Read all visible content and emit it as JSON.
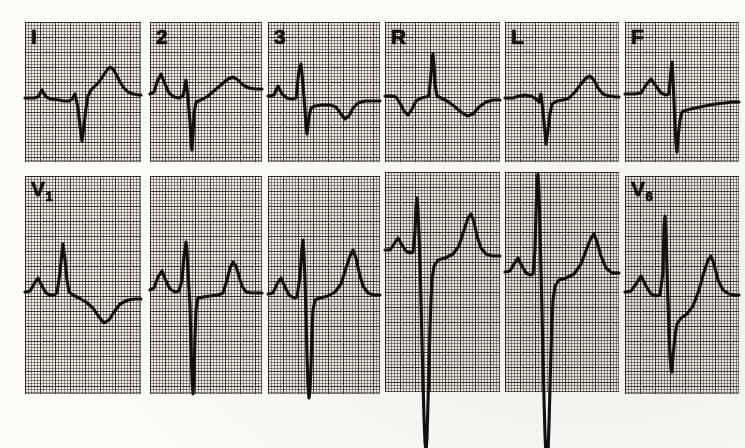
{
  "document": {
    "kind": "12-lead electrocardiogram tracing",
    "paper": "pink ECG graph paper, 1 mm fine grid, 5 mm bold grid",
    "rows": 2,
    "columns": 6,
    "trace_color": "#12100e",
    "grid_bold_color": "#282019",
    "grid_fine_color": "#372d28",
    "paper_color": "#f5efe9",
    "background_color": "#fcfbf8"
  },
  "leads": [
    {
      "id": "lead-1",
      "label": "I",
      "label_sub": "",
      "row": 0,
      "column": 0,
      "x": 25,
      "y": 22,
      "width": 116,
      "height": 140,
      "baseline_y": 76,
      "morphology": "small P, small r, deep narrow QS, elevated ST, broad tall T",
      "path": "M0,76 L9,76 L13,75 L17,68 L21,75 L26,77 L34,78 L39,79 L44,79 L47,77 L50,72 L53,86 L55,104 L57,119 L59,104 L61,86 L63,74 L66,68 L70,64 L74,60 L78,54 L82,48 L85,45 L88,47 L91,52 L95,60 L99,66 L103,70 L108,72 L114,73 L116,73"
    },
    {
      "id": "lead-2",
      "label": "2",
      "label_sub": "",
      "row": 0,
      "column": 1,
      "x": 150,
      "y": 22,
      "width": 112,
      "height": 140,
      "baseline_y": 72,
      "morphology": "P wave, small r, very deep narrow S, elevated ST, broad T",
      "path": "M0,72 L4,70 L7,60 L11,52 L15,62 L19,71 L24,75 L29,76 L33,74 L36,58 L38,76 L40,100 L41,120 L42,128 L43,112 L44,92 L46,80 L51,78 L58,74 L65,68 L72,62 L78,57 L83,55 L88,58 L93,63 L99,66 L106,67 L112,67"
    },
    {
      "id": "lead-3",
      "label": "3",
      "label_sub": "",
      "row": 0,
      "column": 2,
      "x": 268,
      "y": 22,
      "width": 112,
      "height": 140,
      "baseline_y": 74,
      "morphology": "P wave, tall narrow R, deep S, depressed ST with inverted T",
      "path": "M0,74 L6,73 L10,64 L14,72 L19,76 L24,77 L28,76 L31,48 L33,42 L35,62 L37,88 L38,104 L39,112 L41,95 L43,86 L47,84 L54,83 L62,83 L68,85 L73,92 L77,97 L81,94 L85,86 L90,81 L97,79 L105,79 L112,79"
    },
    {
      "id": "lead-R",
      "label": "R",
      "label_sub": "",
      "row": 0,
      "column": 3,
      "x": 385,
      "y": 22,
      "width": 115,
      "height": 140,
      "baseline_y": 74,
      "morphology": "inverted P, tall narrow R spike, inverted T (aVR)",
      "path": "M0,74 L6,74 L11,75 L15,81 L19,89 L23,93 L27,87 L31,79 L36,76 L41,75 L44,74 L46,52 L47,36 L48,32 L49,44 L50,62 L52,74 L56,76 L62,79 L69,84 L76,90 L82,94 L88,92 L94,85 L101,80 L108,78 L115,78"
    },
    {
      "id": "lead-L",
      "label": "L",
      "label_sub": "",
      "row": 0,
      "column": 4,
      "x": 505,
      "y": 22,
      "width": 114,
      "height": 140,
      "baseline_y": 76,
      "morphology": "small P, deep narrow QS, elevated ST, prominent peaked T (aVL)",
      "path": "M0,76 L8,76 L14,74 L20,73 L26,74 L31,77 L34,80 L36,72 L38,90 L40,110 L41,122 L43,108 L45,92 L47,82 L52,79 L58,78 L64,76 L70,70 L76,62 L81,56 L85,54 L89,58 L93,66 L98,72 L104,74 L110,75 L114,75"
    },
    {
      "id": "lead-F",
      "label": "F",
      "label_sub": "",
      "row": 0,
      "column": 5,
      "x": 625,
      "y": 22,
      "width": 114,
      "height": 140,
      "baseline_y": 72,
      "morphology": "P wave, tall narrow R, very deep S, flat depressed ST (aVF)",
      "path": "M0,72 L10,72 L16,71 L21,63 L26,57 L31,64 L36,71 L41,73 L44,72 L46,48 L47,40 L48,56 L49,80 L50,104 L51,122 L52,130 L53,116 L55,98 L57,90 L62,88 L70,86 L80,84 L90,82 L100,81 L108,80 L114,80"
    },
    {
      "id": "lead-V1",
      "label": "V",
      "label_sub": "1",
      "row": 1,
      "column": 0,
      "x": 25,
      "y": 176,
      "width": 116,
      "height": 218,
      "baseline_y": 116,
      "morphology": "small P, narrow tall-ish R, no S, depressed ST with inverted T",
      "path": "M0,116 L5,115 L9,108 L13,102 L17,110 L21,117 L25,119 L29,119 L32,117 L35,96 L37,76 L38,68 L40,84 L42,104 L44,116 L48,119 L54,122 L61,126 L68,132 L74,141 L79,147 L84,144 L89,136 L95,128 L103,124 L110,123 L116,123"
    },
    {
      "id": "lead-V2",
      "label": "",
      "label_sub": "",
      "row": 1,
      "column": 1,
      "x": 150,
      "y": 176,
      "width": 112,
      "height": 218,
      "baseline_y": 114,
      "morphology": "P wave, small r, very deep S running off the lower grid, upright peaked T",
      "path": "M0,114 L4,112 L8,101 L12,95 L16,105 L20,113 L25,116 L29,115 L32,104 L34,80 L36,66 L37,74 L38,96 L40,130 L41,170 L42,205 L43,218 L44,200 L45,160 L46,134 L48,122 L53,121 L60,120 L68,119 L73,117 L77,104 L80,92 L83,86 L86,90 L89,100 L92,110 L96,116 L102,117 L108,117 L112,117"
    },
    {
      "id": "lead-V3",
      "label": "",
      "label_sub": "",
      "row": 1,
      "column": 2,
      "x": 268,
      "y": 176,
      "width": 112,
      "height": 218,
      "baseline_y": 118,
      "morphology": "small P, r spike, very deep S to bottom of grid, tall peaked T",
      "path": "M0,118 L5,117 L9,108 L13,102 L17,111 L21,119 L26,122 L29,121 L32,100 L34,72 L35,64 L36,78 L37,104 L38,140 L39,180 L40,210 L41,222 L42,214 L43,190 L44,158 L45,134 L47,124 L52,122 L60,120 L67,116 L73,108 L78,92 L82,80 L85,74 L88,82 L91,96 L95,110 L100,117 L106,119 L112,119"
    },
    {
      "id": "lead-V4",
      "label": "",
      "label_sub": "",
      "row": 1,
      "column": 3,
      "x": 385,
      "y": 172,
      "width": 115,
      "height": 220,
      "baseline_y": 78,
      "morphology": "P wave, tall R spike above grid, extremely deep S running below the grid, tall peaked T",
      "path": "M0,78 L5,78 L9,72 L13,66 L17,73 L21,79 L25,81 L28,80 L30,60 L31,34 L32,26 L33,38 L34,62 L35,92 L36,130 L37,170 L38,210 L39,245 L40,270 L41,280 L42,266 L43,230 L44,192 L45,156 L46,128 L47,108 L49,94 L53,88 L60,86 L68,82 L74,74 L79,58 L83,46 L86,42 L89,50 L92,64 L96,76 L101,82 L107,84 L115,84"
    },
    {
      "id": "lead-V5",
      "label": "",
      "label_sub": "",
      "row": 1,
      "column": 4,
      "x": 505,
      "y": 172,
      "width": 114,
      "height": 220,
      "baseline_y": 100,
      "morphology": "P wave, R spike running off the top of the grid, extremely deep S running below the grid, tall T",
      "path": "M0,100 L5,99 L9,92 L13,86 L17,94 L21,101 L25,103 L28,102 L30,78 L31,40 L32,10 L33,2 L34,20 L35,58 L36,98 L37,140 L38,185 L39,228 L40,262 L41,285 L42,295 L43,282 L44,252 L45,216 L46,180 L47,150 L48,128 L50,114 L54,108 L61,106 L69,102 L76,92 L82,76 L86,66 L89,62 L92,70 L96,84 L101,96 L107,101 L114,101"
    },
    {
      "id": "lead-V6",
      "label": "V",
      "label_sub": "6",
      "row": 1,
      "column": 5,
      "x": 625,
      "y": 176,
      "width": 114,
      "height": 218,
      "baseline_y": 116,
      "morphology": "P wave, tall narrow R, deep S, tall peaked T",
      "path": "M0,116 L6,115 L11,108 L16,100 L21,110 L26,118 L31,120 L35,119 L38,96 L39,50 L40,40 L41,58 L42,92 L43,126 L44,156 L45,180 L46,194 L47,196 L48,180 L50,160 L52,148 L56,142 L62,138 L68,130 L74,114 L79,96 L83,84 L86,80 L89,88 L93,104 L98,114 L104,118 L110,119 L114,119"
    }
  ]
}
